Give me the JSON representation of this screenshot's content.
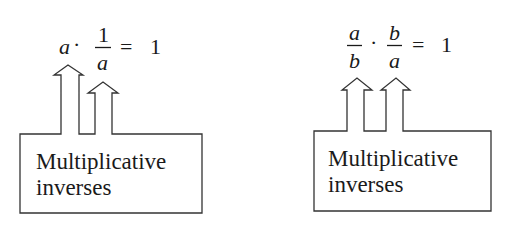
{
  "panels": [
    {
      "equation": {
        "term1": "a",
        "dot": "·",
        "frac_num": "1",
        "frac_den": "a",
        "equals": "=",
        "result": "1"
      },
      "label_line1": "Multiplicative",
      "label_line2": "inverses"
    },
    {
      "equation": {
        "frac1_num": "a",
        "frac1_den": "b",
        "dot": "·",
        "frac2_num": "b",
        "frac2_den": "a",
        "equals": "=",
        "result": "1"
      },
      "label_line1": "Multiplicative",
      "label_line2": "inverses"
    }
  ]
}
